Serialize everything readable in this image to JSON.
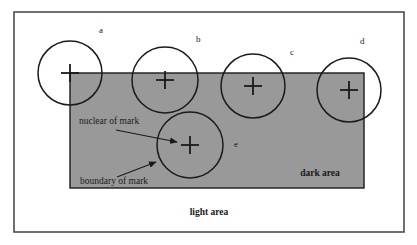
{
  "figure": {
    "title": "",
    "colors": {
      "dark_area_fill": "#999999",
      "light_area_fill": "#ffffff",
      "stroke": "#1a1a1a",
      "frame_stroke": "#4d4d4d",
      "text": "#1a1a1a"
    },
    "frame": {
      "x": 14,
      "y": 12,
      "width": 390,
      "height": 220
    },
    "dark_area": {
      "label": "dark area",
      "label_x": 320,
      "label_y": 176,
      "x": 70,
      "y": 73,
      "width": 294,
      "height": 115
    },
    "light_area": {
      "label": "light area",
      "label_x": 209,
      "label_y": 215
    },
    "circles": [
      {
        "id": "a",
        "label": "a",
        "cx": 70,
        "cy": 73,
        "r": 32,
        "label_x": 99,
        "label_y": 33
      },
      {
        "id": "b",
        "label": "b",
        "cx": 165,
        "cy": 80,
        "r": 33,
        "label_x": 196,
        "label_y": 42
      },
      {
        "id": "c",
        "label": "c",
        "cx": 253,
        "cy": 86,
        "r": 32,
        "label_x": 290,
        "label_y": 55
      },
      {
        "id": "d",
        "label": "d",
        "cx": 349,
        "cy": 90,
        "r": 32,
        "label_x": 360,
        "label_y": 44
      },
      {
        "id": "e",
        "label": "e",
        "cx": 190,
        "cy": 145,
        "r": 33,
        "label_x": 234,
        "label_y": 147
      }
    ],
    "callouts": [
      {
        "id": "nuclear-of-mark",
        "label": "nuclear of mark",
        "label_x": 79,
        "label_y": 124,
        "arrow_x1": 116,
        "arrow_y1": 130,
        "arrow_x2": 177,
        "arrow_y2": 142
      },
      {
        "id": "boundary-of-mark",
        "label": "boundary of mark",
        "label_x": 80,
        "label_y": 184,
        "arrow_x1": 117,
        "arrow_y1": 177,
        "arrow_x2": 156,
        "arrow_y2": 162
      }
    ],
    "cross_marks": {
      "arm_length": 9,
      "note": "cross drawn at each circle centre representing the nuclear of mark"
    }
  }
}
